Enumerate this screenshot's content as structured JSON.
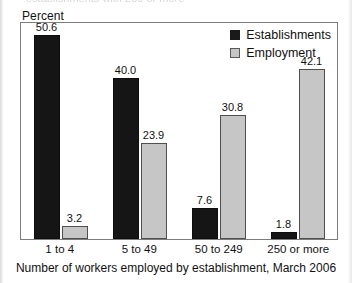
{
  "document": {
    "cropped_header_text": "establishments with 250 or more"
  },
  "axis": {
    "y_label": "Percent",
    "x_title": "Number of workers employed by establishment, March 2006"
  },
  "legend": {
    "items": [
      {
        "label": "Establishments",
        "swatch": "dark-square-swatch",
        "color": "#151515"
      },
      {
        "label": "Employment",
        "swatch": "light-square-swatch",
        "color": "#c6c6c6"
      }
    ]
  },
  "chart_data": {
    "type": "bar",
    "title": "",
    "subtitle": "",
    "xlabel": "Number of workers employed by establishment, March 2006",
    "ylabel": "Percent",
    "categories": [
      "1 to 4",
      "5 to 49",
      "50 to 249",
      "250 or more"
    ],
    "series": [
      {
        "name": "Establishments",
        "color": "#151515",
        "values": [
          50.6,
          40.0,
          7.6,
          1.8
        ]
      },
      {
        "name": "Employment",
        "color": "#c6c6c6",
        "values": [
          3.2,
          23.9,
          30.8,
          42.1
        ]
      }
    ],
    "ylim": [
      0,
      54
    ],
    "grid": false,
    "y_ticks_visible": false,
    "legend_position": "top-right",
    "data_labels": true,
    "data_label_format": "one-decimal"
  }
}
